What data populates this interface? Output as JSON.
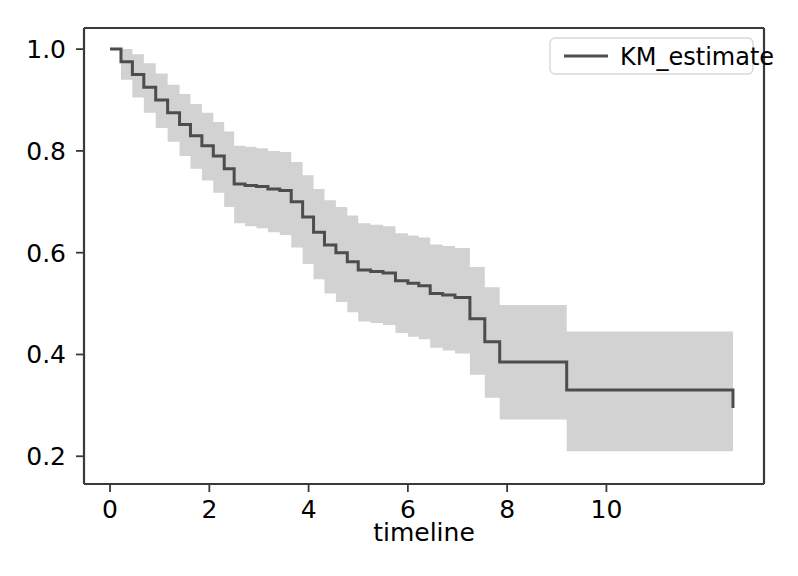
{
  "figure": {
    "width": 798,
    "height": 576,
    "background": "#ffffff"
  },
  "axes": {
    "left_px": 84,
    "right_px": 764,
    "top_px": 28,
    "bottom_px": 484,
    "spine_color": "#3a3a3a",
    "spine_width": 2.2
  },
  "legend": {
    "label": "KM_estimate",
    "box_color": "#ffffff",
    "border_color": "#d8d8d8",
    "line_color": "#4d4d4d"
  },
  "chart_data": {
    "type": "line",
    "title": "",
    "xlabel": "timeline",
    "ylabel": "",
    "xlim": [
      -0.525,
      13.175
    ],
    "ylim": [
      0.1455,
      1.0415
    ],
    "xticks": [
      0,
      2,
      4,
      6,
      8,
      10
    ],
    "xtick_labels": [
      "0",
      "2",
      "4",
      "6",
      "8",
      "10"
    ],
    "yticks": [
      0.2,
      0.4,
      0.6,
      0.8,
      1.0
    ],
    "ytick_labels": [
      "0.2",
      "0.4",
      "0.6",
      "0.8",
      "1.0"
    ],
    "grid": false,
    "legend_position": "upper right",
    "line_color": "#4d4d4d",
    "line_width": 3.0,
    "band_color": "#d2d2d2",
    "band_alpha": 1.0,
    "drawstyle": "steps-post",
    "series": [
      {
        "name": "KM_estimate",
        "x": [
          0.0,
          0.22,
          0.45,
          0.68,
          0.92,
          1.16,
          1.4,
          1.62,
          1.85,
          2.08,
          2.3,
          2.5,
          2.72,
          2.95,
          3.18,
          3.42,
          3.65,
          3.88,
          4.1,
          4.32,
          4.55,
          4.78,
          5.0,
          5.25,
          5.5,
          5.75,
          6.0,
          6.22,
          6.45,
          6.7,
          6.95,
          7.25,
          7.55,
          7.85,
          9.2,
          12.55
        ],
        "y": [
          1.0,
          0.975,
          0.95,
          0.925,
          0.9,
          0.875,
          0.852,
          0.83,
          0.81,
          0.79,
          0.765,
          0.735,
          0.732,
          0.73,
          0.725,
          0.722,
          0.7,
          0.67,
          0.64,
          0.615,
          0.6,
          0.582,
          0.566,
          0.563,
          0.56,
          0.545,
          0.54,
          0.535,
          0.52,
          0.517,
          0.512,
          0.47,
          0.425,
          0.385,
          0.33,
          0.295
        ],
        "lower": [
          1.0,
          0.94,
          0.905,
          0.875,
          0.845,
          0.818,
          0.79,
          0.765,
          0.742,
          0.718,
          0.69,
          0.658,
          0.652,
          0.648,
          0.64,
          0.635,
          0.61,
          0.578,
          0.548,
          0.52,
          0.503,
          0.483,
          0.465,
          0.462,
          0.458,
          0.442,
          0.435,
          0.43,
          0.413,
          0.408,
          0.402,
          0.36,
          0.315,
          0.272,
          0.21,
          0.172
        ],
        "upper": [
          1.0,
          1.0,
          0.99,
          0.972,
          0.952,
          0.93,
          0.912,
          0.892,
          0.875,
          0.857,
          0.838,
          0.81,
          0.808,
          0.805,
          0.8,
          0.798,
          0.778,
          0.752,
          0.725,
          0.703,
          0.69,
          0.673,
          0.658,
          0.655,
          0.652,
          0.638,
          0.634,
          0.63,
          0.616,
          0.613,
          0.609,
          0.572,
          0.532,
          0.497,
          0.445,
          0.418
        ]
      }
    ]
  }
}
